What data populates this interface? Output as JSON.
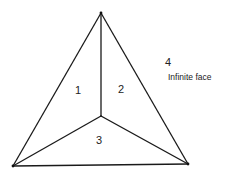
{
  "diagram": {
    "type": "planar-graph",
    "vertices": [
      "top",
      "bottom-left",
      "bottom-right",
      "center"
    ],
    "edges": [
      [
        "top",
        "bottom-left"
      ],
      [
        "top",
        "bottom-right"
      ],
      [
        "bottom-left",
        "bottom-right"
      ],
      [
        "top",
        "center"
      ],
      [
        "bottom-left",
        "center"
      ],
      [
        "bottom-right",
        "center"
      ]
    ],
    "faces": [
      {
        "id": "1",
        "label": "1"
      },
      {
        "id": "2",
        "label": "2"
      },
      {
        "id": "3",
        "label": "3"
      },
      {
        "id": "4",
        "label": "4",
        "note": "Infinite face"
      }
    ],
    "colors": {
      "line": "#1a1a1a",
      "text": "#222222",
      "background": "#ffffff"
    }
  }
}
